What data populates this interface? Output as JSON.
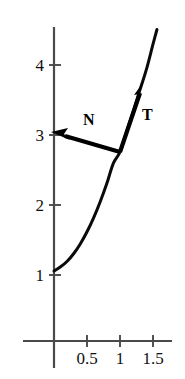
{
  "figure": {
    "background_color": "#ffffff",
    "axis_color": "#4a4a4a",
    "curve_color": "#0a0a0a",
    "vector_color": "#000000"
  },
  "axes": {
    "x": {
      "tick_values": [
        0.5,
        1,
        1.5
      ],
      "tick_labels": [
        "0.5",
        "1",
        "1.5"
      ],
      "pixel_positions": [
        87,
        120,
        153
      ],
      "axis_pixel_y": 341,
      "axis_pixel_x_start": 23,
      "axis_pixel_x_end": 172,
      "units_per_pixel": 66,
      "origin_pixel_x": 54
    },
    "y": {
      "tick_values": [
        1,
        2,
        3,
        4
      ],
      "tick_labels": [
        "1",
        "2",
        "3",
        "4"
      ],
      "pixel_positions": [
        275,
        205,
        135,
        65
      ],
      "axis_pixel_x": 54,
      "axis_pixel_y_start": 27,
      "axis_pixel_y_end": 368,
      "units_per_pixel": 70,
      "origin_pixel_y": 341
    }
  },
  "chart_data": {
    "type": "line",
    "title": "",
    "xlabel": "",
    "ylabel": "",
    "xlim": [
      -0.47,
      1.79
    ],
    "ylim": [
      -0.39,
      4.49
    ],
    "grid": false,
    "legend": "none",
    "series": [
      {
        "name": "curve",
        "description": "Upward-curving arc from (0,1) rising to the upper right",
        "x": [
          0.0,
          0.1,
          0.2,
          0.3,
          0.4,
          0.5,
          0.6,
          0.7,
          0.8,
          0.9,
          1.0,
          1.1,
          1.2,
          1.3,
          1.4,
          1.5,
          1.56
        ],
        "y": [
          1.0,
          1.06,
          1.14,
          1.25,
          1.39,
          1.56,
          1.76,
          1.99,
          2.25,
          2.54,
          2.7,
          2.99,
          3.28,
          3.58,
          3.88,
          4.24,
          4.45
        ]
      }
    ],
    "annotations": [
      {
        "name": "tangent-vector",
        "label": "T",
        "tail": [
          1.0,
          2.7
        ],
        "tip": [
          1.35,
          3.66
        ],
        "label_position": [
          1.42,
          3.23
        ]
      },
      {
        "name": "normal-vector",
        "label": "N",
        "tail": [
          1.0,
          2.7
        ],
        "tip": [
          -0.03,
          2.97
        ],
        "label_position": [
          0.52,
          3.16
        ]
      },
      {
        "name": "curve-start-point",
        "label": "",
        "position": [
          0.0,
          1.0
        ]
      }
    ]
  },
  "labels": {
    "x_ticks": [
      {
        "text": "0.5",
        "pixel_x": 87,
        "pixel_y": 355
      },
      {
        "text": "1",
        "pixel_x": 120,
        "pixel_y": 355
      },
      {
        "text": "1.5",
        "pixel_x": 153,
        "pixel_y": 355
      }
    ],
    "y_ticks": [
      {
        "text": "4",
        "pixel_x": 44,
        "pixel_y": 65
      },
      {
        "text": "3",
        "pixel_x": 44,
        "pixel_y": 135
      },
      {
        "text": "2",
        "pixel_x": 44,
        "pixel_y": 205
      },
      {
        "text": "1",
        "pixel_x": 44,
        "pixel_y": 275
      }
    ],
    "vectors": [
      {
        "text": "T",
        "pixel_x": 148,
        "pixel_y": 115
      },
      {
        "text": "N",
        "pixel_x": 88,
        "pixel_y": 120
      }
    ]
  }
}
